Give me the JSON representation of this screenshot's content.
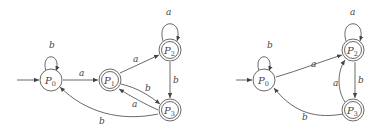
{
  "diagrams": [
    {
      "name": "left-automaton",
      "states": [
        {
          "id": "P0",
          "label": "P",
          "sub": "0",
          "accepting": false,
          "initial": true
        },
        {
          "id": "P1",
          "label": "P",
          "sub": "1",
          "accepting": true,
          "initial": false
        },
        {
          "id": "P2",
          "label": "P",
          "sub": "2",
          "accepting": true,
          "initial": false
        },
        {
          "id": "P3",
          "label": "P",
          "sub": "3",
          "accepting": true,
          "initial": false
        }
      ],
      "transitions": [
        {
          "from": "P0",
          "to": "P0",
          "symbol": "b"
        },
        {
          "from": "P0",
          "to": "P1",
          "symbol": "a"
        },
        {
          "from": "P1",
          "to": "P2",
          "symbol": "a"
        },
        {
          "from": "P1",
          "to": "P3",
          "symbol": "b"
        },
        {
          "from": "P3",
          "to": "P1",
          "symbol": "a"
        },
        {
          "from": "P2",
          "to": "P2",
          "symbol": "a"
        },
        {
          "from": "P2",
          "to": "P3",
          "symbol": "b"
        },
        {
          "from": "P3",
          "to": "P0",
          "symbol": "b"
        }
      ]
    },
    {
      "name": "right-automaton",
      "states": [
        {
          "id": "P0",
          "label": "P",
          "sub": "0",
          "accepting": false,
          "initial": true
        },
        {
          "id": "P2",
          "label": "P",
          "sub": "2",
          "accepting": true,
          "initial": false
        },
        {
          "id": "P3",
          "label": "P",
          "sub": "3",
          "accepting": true,
          "initial": false
        }
      ],
      "transitions": [
        {
          "from": "P0",
          "to": "P0",
          "symbol": "b"
        },
        {
          "from": "P0",
          "to": "P2",
          "symbol": "a"
        },
        {
          "from": "P2",
          "to": "P2",
          "symbol": "a"
        },
        {
          "from": "P2",
          "to": "P3",
          "symbol": "b"
        },
        {
          "from": "P3",
          "to": "P2",
          "symbol": "a"
        },
        {
          "from": "P3",
          "to": "P0",
          "symbol": "b"
        }
      ]
    }
  ],
  "labels": {
    "L": {
      "P0": "P",
      "P0s": "0",
      "P1": "P",
      "P1s": "1",
      "P2": "P",
      "P2s": "2",
      "P3": "P",
      "P3s": "3",
      "loop_p0": "b",
      "p0_p1": "a",
      "p1_p2": "a",
      "p1_p3": "b",
      "p3_p1": "a",
      "loop_p2": "a",
      "p2_p3": "b",
      "p3_p0": "b"
    },
    "R": {
      "P0": "P",
      "P0s": "0",
      "P2": "P",
      "P2s": "2",
      "P3": "P",
      "P3s": "3",
      "loop_p0": "b",
      "p0_p2": "a",
      "loop_p2": "a",
      "p2_p3": "b",
      "p3_p2": "a",
      "p3_p0": "b"
    }
  }
}
